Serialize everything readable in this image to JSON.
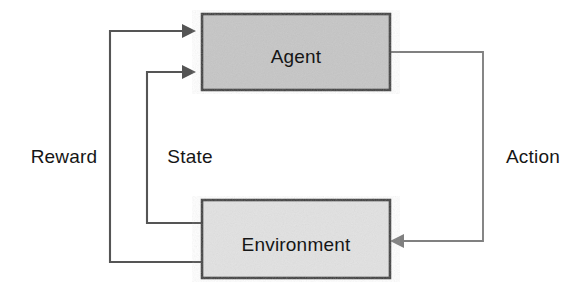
{
  "diagram": {
    "type": "reinforcement-learning-loop",
    "nodes": [
      {
        "id": "agent",
        "label": "Agent",
        "shape": "rectangle",
        "fill": "#c6c6c6",
        "stroke": "#3b3b3b",
        "x": 202,
        "y": 14,
        "width": 188,
        "height": 76,
        "label_x": 296,
        "label_y": 58
      },
      {
        "id": "environment",
        "label": "Environment",
        "shape": "rectangle",
        "fill": "#e2e2e2",
        "stroke": "#3b3b3b",
        "x": 202,
        "y": 200,
        "width": 188,
        "height": 78,
        "label_x": 296,
        "label_y": 246
      }
    ],
    "edges": [
      {
        "id": "reward-edge",
        "label": "Reward",
        "from": "environment",
        "to": "agent",
        "arrowhead": "right",
        "stroke": "#555555",
        "path": "M 202 262 L 110 262 L 110 31 L 182 31",
        "arrow_points": "182,24 196,31 182,38",
        "label_x": 64,
        "label_y": 158
      },
      {
        "id": "state-edge",
        "label": "State",
        "from": "environment",
        "to": "agent",
        "arrowhead": "right",
        "stroke": "#555555",
        "path": "M 202 223 L 147 223 L 147 72 L 182 72",
        "arrow_points": "182,65 196,72 182,79",
        "label_x": 190,
        "label_y": 158
      },
      {
        "id": "action-edge",
        "label": "Action",
        "from": "agent",
        "to": "environment",
        "arrowhead": "left",
        "stroke": "#808080",
        "path": "M 390 52 L 483 52 L 483 241 L 404 241",
        "arrow_points": "404,234 390,241 404,248",
        "label_x": 533,
        "label_y": 158
      }
    ],
    "colors": {
      "background": "#ffffff",
      "agent_fill": "#c6c6c6",
      "environment_fill": "#e2e2e2",
      "box_stroke": "#3b3b3b",
      "dark_edge": "#555555",
      "light_edge": "#808080",
      "text": "#161616"
    }
  }
}
